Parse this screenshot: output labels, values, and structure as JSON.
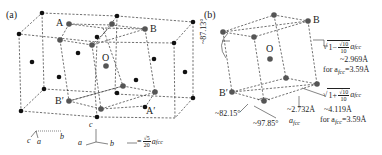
{
  "figure": {
    "panel_a": {
      "label": "(a)",
      "sites": {
        "A": "A",
        "B": "B",
        "O": "O",
        "A_prime": "A′",
        "B_prime": "B′"
      },
      "axes_left": {
        "c": "c",
        "a": "a",
        "b": "b"
      },
      "axes_right": {
        "c": "c",
        "a": "a",
        "b": "b"
      },
      "scale_bar": {
        "arrow": "→",
        "eq": "=",
        "sqrt_num": "√5",
        "den": "20",
        "unit": "a",
        "unit_sub": "fcc"
      }
    },
    "panel_b": {
      "label": "(b)",
      "sites": {
        "B": "B",
        "O": "O",
        "B_prime": "B′"
      },
      "angle_top": "~87.13°",
      "angle_left": "~82.15°",
      "angle_bottom": "~97.85°",
      "dist_small": "~2.732Å",
      "dist_small_unit": "a",
      "dist_small_unit_sub": "fcc",
      "upper_formula": {
        "prefix": "1−",
        "num": "√10",
        "den": "10",
        "unit": "a",
        "unit_sub": "fcc"
      },
      "upper_value": "~2.969Å",
      "upper_cond": {
        "prefix": "for a",
        "sub": "fcc",
        "suffix": "=3.59Å"
      },
      "lower_formula": {
        "prefix": "1+",
        "num": "√10",
        "den": "10",
        "unit": "a",
        "unit_sub": "fcc"
      },
      "lower_value": "~4.119Å",
      "lower_cond": {
        "prefix": "for a",
        "sub": "fcc",
        "suffix": "=3.59Å"
      }
    },
    "colors": {
      "atom_black": "#111111",
      "atom_grey": "#555555",
      "line": "#333333"
    }
  }
}
